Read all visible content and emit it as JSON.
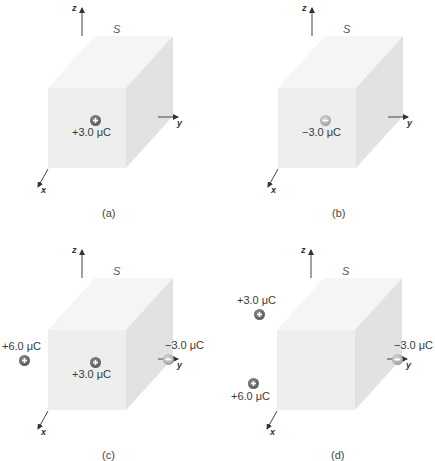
{
  "surface_label": "S",
  "axes": {
    "x": "x",
    "y": "y",
    "z": "z"
  },
  "colors": {
    "cube_front": "#eeeeee",
    "cube_top": "#f5f5f5",
    "cube_side": "#e2e2e2",
    "pos_charge": "#5a5a5a",
    "neg_charge": "#b0b0b0"
  },
  "panels": [
    {
      "caption": "(a)",
      "charges": [
        {
          "label": "+3.0 μC",
          "sign": "positive",
          "location": "inside"
        }
      ]
    },
    {
      "caption": "(b)",
      "charges": [
        {
          "label": "−3.0 μC",
          "sign": "negative",
          "location": "inside"
        }
      ]
    },
    {
      "caption": "(c)",
      "charges": [
        {
          "label": "+3.0 μC",
          "sign": "positive",
          "location": "inside"
        },
        {
          "label": "+6.0 μC",
          "sign": "positive",
          "location": "outside-left"
        },
        {
          "label": "−3.0 μC",
          "sign": "negative",
          "location": "outside-right"
        }
      ]
    },
    {
      "caption": "(d)",
      "charges": [
        {
          "label": "+3.0 μC",
          "sign": "positive",
          "location": "outside-upper-left"
        },
        {
          "label": "+6.0 μC",
          "sign": "positive",
          "location": "outside-lower-left"
        },
        {
          "label": "−3.0 μC",
          "sign": "negative",
          "location": "outside-right"
        }
      ]
    }
  ]
}
